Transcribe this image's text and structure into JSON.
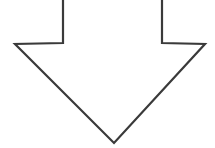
{
  "canvas": {
    "width": 215,
    "height": 148,
    "background_color": "#ffffff"
  },
  "diagram": {
    "shape_name": "downward block arrow outline",
    "direction": "down",
    "style": {
      "fill_color": "#ffffff",
      "stroke_color": "#3a3a3a",
      "stroke_width": 2.2,
      "stroke_linejoin": "miter",
      "closed_outline": false,
      "top_edge_cropped": true
    },
    "geometry": {
      "shaft_left_x": 63,
      "shaft_right_x": 162,
      "shoulder_y": 43,
      "head_left_x": 15,
      "head_right_x": 205,
      "tip_x": 114,
      "tip_y": 143,
      "top_y": 0
    },
    "path_points": [
      [
        63,
        0
      ],
      [
        63,
        43
      ],
      [
        15,
        44
      ],
      [
        114,
        143
      ],
      [
        205,
        44
      ],
      [
        162,
        43
      ],
      [
        162,
        0
      ]
    ],
    "path_d": "M 63 -2 L 63 43 L 15 44 L 114 143 L 205 44 L 162 43 L 162 -2"
  }
}
